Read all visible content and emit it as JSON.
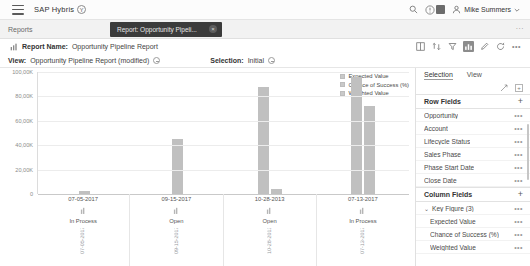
{
  "shell": {
    "menu_icon": "hamburger-menu-icon",
    "brand": "SAP Hybris",
    "brand_badge": "Y",
    "search_icon": "search-icon",
    "notification_icon": "notification-bell-icon",
    "avatar_icon": "user-avatar-icon",
    "user_name": "Mike Summers",
    "user_chevron": "chevron-down-icon"
  },
  "breadcrumb": {
    "root": "Reports",
    "overflow": "...",
    "tab": {
      "label": "Report: Opportunity Pipeli...",
      "close": "×"
    }
  },
  "report_header": {
    "chart_glyph": "bar-chart-icon",
    "name_label": "Report Name:",
    "name_value": "Opportunity Pipeline Report",
    "toolbar": [
      {
        "name": "table-view-icon",
        "glyph": "▥",
        "active": false
      },
      {
        "name": "sort-icon",
        "glyph": "⇅",
        "active": false
      },
      {
        "name": "filter-icon",
        "glyph": "▽",
        "active": false
      },
      {
        "name": "chart-view-icon",
        "glyph": "▥",
        "active": true
      },
      {
        "name": "settings-icon",
        "glyph": "✎",
        "active": false
      },
      {
        "name": "refresh-icon",
        "glyph": "⟳",
        "active": false
      },
      {
        "name": "overflow-icon",
        "glyph": "•••",
        "active": false
      }
    ]
  },
  "view_row": {
    "view_label": "View:",
    "view_value": "Opportunity Pipeline Report (modified)",
    "view_status_icon": "info-circle-icon",
    "selection_label": "Selection:",
    "selection_value": "Initial",
    "selection_status_icon": "info-circle-icon"
  },
  "chart_data": {
    "type": "bar",
    "title": "Opportunity Pipeline Report",
    "xlabel": "",
    "ylabel": "",
    "ylim": [
      0,
      100000
    ],
    "grid": true,
    "legend_position": "top-right",
    "ytick_labels": [
      "100,00K",
      "80,00K",
      "60,00K",
      "40,00K",
      "20,00K",
      "0"
    ],
    "ytick_values": [
      100000,
      80000,
      60000,
      40000,
      20000,
      0
    ],
    "categories": [
      "07-05-2017",
      "09-15-2017",
      "10-28-2013",
      "07-13-2017"
    ],
    "category_status": [
      "In Process",
      "Open",
      "Open",
      "In Process"
    ],
    "series": [
      {
        "name": "Expected Value",
        "values": [
          2500,
          0,
          0,
          0
        ]
      },
      {
        "name": "Chance of Success (%)",
        "values": [
          1200,
          45000,
          3500,
          88000
        ]
      },
      {
        "name": "Weighted Value",
        "values": [
          800,
          0,
          0,
          72000
        ]
      }
    ],
    "bars": [
      {
        "category": "07-05-2017",
        "value": 2200
      },
      {
        "category": "09-15-2017",
        "value": 45000
      },
      {
        "category": "10-28-2013",
        "value": 88000
      },
      {
        "category": "10-28-2013b",
        "value": 4000
      },
      {
        "category": "07-13-2017",
        "value": 96000
      },
      {
        "category": "07-13-2017b",
        "value": 72000
      }
    ],
    "bar_color": "#c0c0c0"
  },
  "legend": [
    {
      "label": "Expected Value",
      "color": "#c9c9c9"
    },
    {
      "label": "Chance of Success (%)",
      "color": "#c9c9c9"
    },
    {
      "label": "Weighted Value",
      "color": "#c9c9c9"
    }
  ],
  "side_panel": {
    "tabs": [
      {
        "label": "Selection",
        "selected": true
      },
      {
        "label": "View",
        "selected": false
      }
    ],
    "icons": [
      {
        "name": "expand-collapse-icon",
        "glyph": "⤢"
      },
      {
        "name": "add-column-icon",
        "glyph": "+"
      }
    ],
    "sections": [
      {
        "title": "Row Fields",
        "add": "+",
        "items": [
          {
            "label": "Opportunity",
            "indent": 0,
            "menu": "•••"
          },
          {
            "label": "Account",
            "indent": 0,
            "menu": "•••"
          },
          {
            "label": "Lifecycle Status",
            "indent": 0,
            "menu": "•••"
          },
          {
            "label": "Sales Phase",
            "indent": 0,
            "menu": "•••"
          },
          {
            "label": "Phase Start Date",
            "indent": 0,
            "menu": "•••"
          },
          {
            "label": "Close Date",
            "indent": 0,
            "menu": "•••"
          }
        ]
      },
      {
        "title": "Column Fields",
        "add": "+",
        "items": [
          {
            "label": "Key Figure (3)",
            "indent": 0,
            "menu": "•••",
            "caret": "⌄"
          },
          {
            "label": "Expected Value",
            "indent": 1,
            "menu": "•••"
          },
          {
            "label": "Chance of Success (%)",
            "indent": 1,
            "menu": "•••"
          },
          {
            "label": "Weighted Value",
            "indent": 1,
            "menu": "•••"
          }
        ]
      }
    ]
  }
}
